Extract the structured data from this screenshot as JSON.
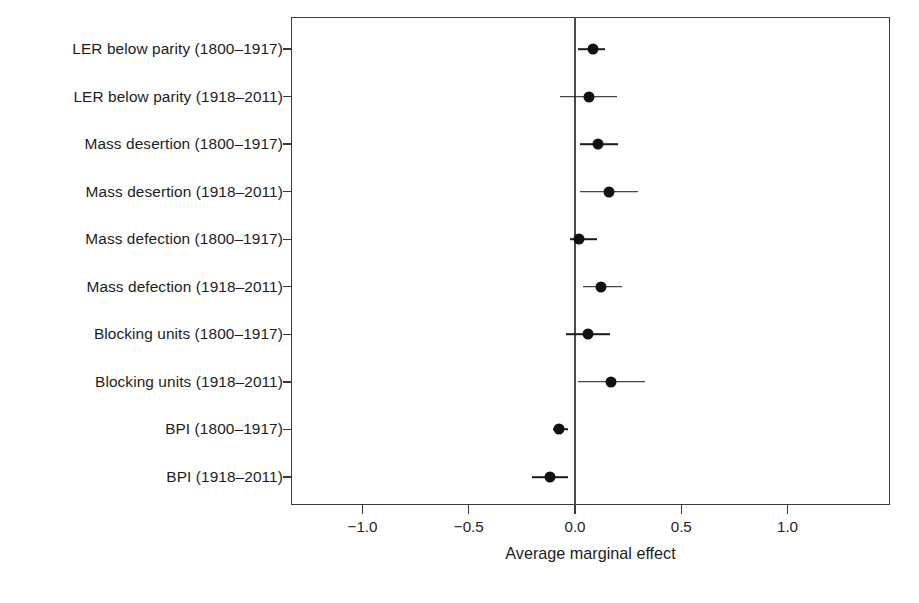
{
  "chart_data": {
    "type": "scatter",
    "subtype": "coefficient-plot",
    "title": "",
    "xlabel": "Average marginal effect",
    "ylabel": "",
    "xlim": [
      -1.34,
      1.48
    ],
    "ylim": [
      0,
      11
    ],
    "grid": false,
    "legend": null,
    "xticks": [
      -1.0,
      -0.5,
      0.0,
      0.5,
      1.0
    ],
    "xticklabels": [
      "−1.0",
      "−0.5",
      "0.0",
      "0.5",
      "1.0"
    ],
    "reference_line": 0.0,
    "categories": [
      "LER below parity (1800–1917)",
      "LER below parity (1918–2011)",
      "Mass desertion (1800–1917)",
      "Mass desertion (1918–2011)",
      "Mass defection (1800–1917)",
      "Mass defection (1918–2011)",
      "Blocking units (1800–1917)",
      "Blocking units (1918–2011)",
      "BPI (1800–1917)",
      "BPI (1918–2011)"
    ],
    "values": [
      0.085,
      0.066,
      0.108,
      0.16,
      0.019,
      0.123,
      0.061,
      0.17,
      -0.075,
      -0.118
    ],
    "ci_low": [
      0.014,
      -0.071,
      0.024,
      0.024,
      -0.024,
      0.038,
      -0.042,
      0.014,
      -0.104,
      -0.203
    ],
    "ci_high": [
      0.142,
      0.198,
      0.203,
      0.297,
      0.104,
      0.222,
      0.165,
      0.33,
      -0.033,
      -0.033
    ],
    "points": [
      {
        "label": "LER below parity (1800–1917)",
        "estimate": 0.085,
        "ci_low": 0.014,
        "ci_high": 0.142
      },
      {
        "label": "LER below parity (1918–2011)",
        "estimate": 0.066,
        "ci_low": -0.071,
        "ci_high": 0.198
      },
      {
        "label": "Mass desertion (1800–1917)",
        "estimate": 0.108,
        "ci_low": 0.024,
        "ci_high": 0.203
      },
      {
        "label": "Mass desertion (1918–2011)",
        "estimate": 0.16,
        "ci_low": 0.024,
        "ci_high": 0.297
      },
      {
        "label": "Mass defection (1800–1917)",
        "estimate": 0.019,
        "ci_low": -0.024,
        "ci_high": 0.104
      },
      {
        "label": "Mass defection (1918–2011)",
        "estimate": 0.123,
        "ci_low": 0.038,
        "ci_high": 0.222
      },
      {
        "label": "Blocking units (1800–1917)",
        "estimate": 0.061,
        "ci_low": -0.042,
        "ci_high": 0.165
      },
      {
        "label": "Blocking units (1918–2011)",
        "estimate": 0.17,
        "ci_low": 0.014,
        "ci_high": 0.33
      },
      {
        "label": "BPI (1800–1917)",
        "estimate": -0.075,
        "ci_low": -0.104,
        "ci_high": -0.033
      },
      {
        "label": "BPI (1918–2011)",
        "estimate": -0.118,
        "ci_low": -0.203,
        "ci_high": -0.033
      }
    ],
    "colors": {
      "marker": "#111111",
      "ci": "#1a1a1a",
      "axis": "#3a3a3a",
      "reference": "#4a4a4a",
      "text": "#1d1d1d",
      "background": "#ffffff"
    }
  }
}
